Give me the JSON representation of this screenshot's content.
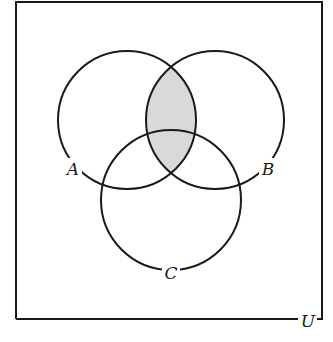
{
  "diagram": {
    "type": "venn",
    "sets": [
      {
        "id": "A",
        "label": "A",
        "cx": 127,
        "cy": 120,
        "r": 69
      },
      {
        "id": "B",
        "label": "B",
        "cx": 215,
        "cy": 120,
        "r": 69
      },
      {
        "id": "C",
        "label": "C",
        "cx": 171,
        "cy": 200,
        "r": 70
      }
    ],
    "universe": {
      "label": "U",
      "x": 16,
      "y": 2,
      "width": 306,
      "height": 317
    },
    "shaded_region": "A ∩ B",
    "colors": {
      "stroke": "#1a1a1a",
      "shade": "#d9d9d9",
      "background": "#ffffff"
    }
  },
  "labels": {
    "A": "A",
    "B": "B",
    "C": "C",
    "U": "U"
  }
}
